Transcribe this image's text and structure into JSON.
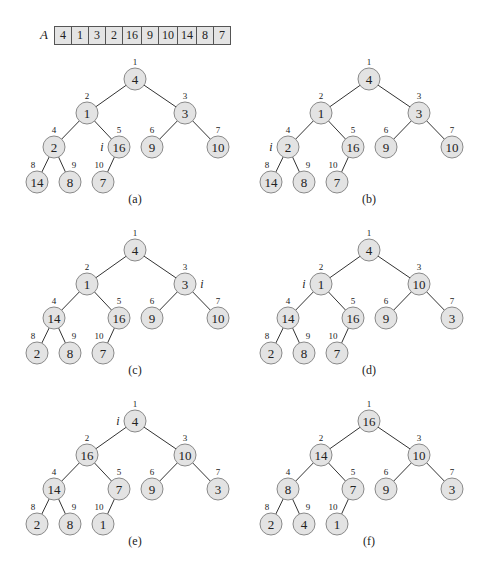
{
  "array": {
    "label": "A",
    "values": [
      "4",
      "1",
      "3",
      "2",
      "16",
      "9",
      "10",
      "14",
      "8",
      "7"
    ],
    "cell_widths": [
      16,
      16,
      16,
      16,
      18,
      16,
      18,
      18,
      16,
      16
    ]
  },
  "colors": {
    "node_fill": "#e3e3e3",
    "node_stroke": "#8a8a8a",
    "edge": "#333333",
    "text": "#222222"
  },
  "panels": [
    {
      "id": "a",
      "caption": "(a)",
      "values": [
        4,
        1,
        3,
        2,
        16,
        9,
        10,
        14,
        8,
        7
      ],
      "i_index": 5,
      "i_side": "left"
    },
    {
      "id": "b",
      "caption": "(b)",
      "values": [
        4,
        1,
        3,
        2,
        16,
        9,
        10,
        14,
        8,
        7
      ],
      "i_index": 4,
      "i_side": "left"
    },
    {
      "id": "c",
      "caption": "(c)",
      "values": [
        4,
        1,
        3,
        14,
        16,
        9,
        10,
        2,
        8,
        7
      ],
      "i_index": 3,
      "i_side": "right"
    },
    {
      "id": "d",
      "caption": "(d)",
      "values": [
        4,
        1,
        10,
        14,
        16,
        9,
        3,
        2,
        8,
        7
      ],
      "i_index": 2,
      "i_side": "left"
    },
    {
      "id": "e",
      "caption": "(e)",
      "values": [
        4,
        16,
        10,
        14,
        7,
        9,
        3,
        2,
        8,
        1
      ],
      "i_index": 1,
      "i_side": "left"
    },
    {
      "id": "f",
      "caption": "(f)",
      "values": [
        16,
        14,
        10,
        8,
        7,
        9,
        3,
        2,
        4,
        1
      ],
      "i_index": null,
      "i_side": null
    }
  ],
  "index_labels": [
    "1",
    "2",
    "3",
    "4",
    "5",
    "6",
    "7",
    "8",
    "9",
    "10"
  ],
  "i_label": "i"
}
